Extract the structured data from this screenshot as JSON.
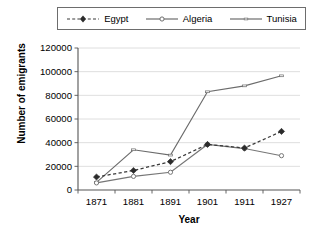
{
  "chart_data": {
    "type": "line",
    "title": "",
    "xlabel": "Year",
    "ylabel": "Number of emigrants",
    "categories": [
      "1871",
      "1881",
      "1891",
      "1901",
      "1911",
      "1927"
    ],
    "ylim": [
      0,
      120000
    ],
    "ytick_labels": [
      "0",
      "20000",
      "40000",
      "60000",
      "80000",
      "100000",
      "120000"
    ],
    "ytick_values": [
      0,
      20000,
      40000,
      60000,
      80000,
      100000,
      120000
    ],
    "grid": "horizontal",
    "legend_position": "top",
    "series": [
      {
        "name": "Egypt",
        "style": "dashed",
        "marker": "filled-diamond",
        "color": "#3a3a3a",
        "values": [
          11000,
          16500,
          24000,
          38500,
          35500,
          49500
        ]
      },
      {
        "name": "Algeria",
        "style": "solid",
        "marker": "open-circle",
        "color": "#767676",
        "values": [
          6000,
          11500,
          15000,
          38500,
          35000,
          29000
        ]
      },
      {
        "name": "Tunisia",
        "style": "solid",
        "marker": "small-dash",
        "color": "#6b6b6b",
        "values": [
          6500,
          34000,
          29500,
          83000,
          88000,
          96500
        ]
      }
    ]
  },
  "legend": {
    "items": [
      {
        "label": "Egypt"
      },
      {
        "label": "Algeria"
      },
      {
        "label": "Tunisia"
      }
    ]
  },
  "axes": {
    "x_title": "Year",
    "y_title": "Number of emigrants"
  }
}
